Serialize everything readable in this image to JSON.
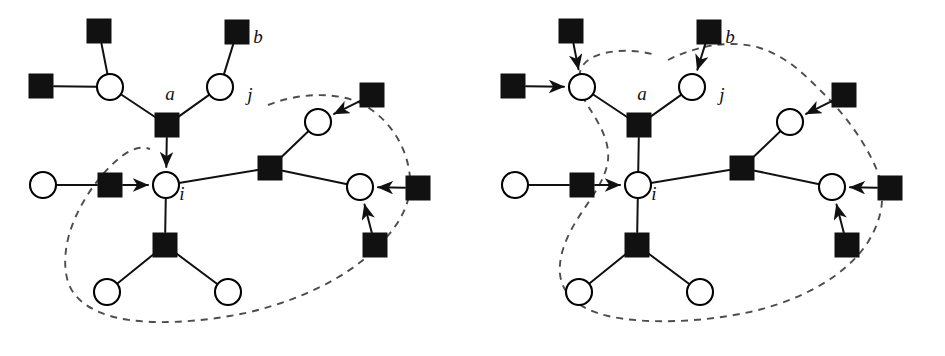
{
  "figure": {
    "colors": {
      "variable_node_fill": "#ffffff",
      "factor_node_fill": "#111111",
      "edge": "#111111",
      "region_boundary": "#4d4d4d",
      "background": "#ffffff"
    },
    "legend_note": ""
  },
  "panels": [
    {
      "id": "left",
      "name": "panel-left",
      "region_label": "",
      "labels": [
        {
          "id": "a",
          "text": "a",
          "x": 170,
          "y": 100
        },
        {
          "id": "b",
          "text": "b",
          "x": 258,
          "y": 43
        },
        {
          "id": "i",
          "text": "i",
          "x": 182,
          "y": 200
        },
        {
          "id": "j",
          "text": "j",
          "x": 250,
          "y": 101
        }
      ],
      "variable_nodes": [
        {
          "id": "v_tl",
          "name": "variable-node-top-left",
          "x": 110,
          "y": 87
        },
        {
          "id": "v_j",
          "name": "variable-node-j",
          "x": 220,
          "y": 87
        },
        {
          "id": "v_left",
          "name": "variable-node-left",
          "x": 43,
          "y": 185
        },
        {
          "id": "v_i",
          "name": "variable-node-i",
          "x": 166,
          "y": 185
        },
        {
          "id": "v_ur",
          "name": "variable-node-upper-right",
          "x": 318,
          "y": 122
        },
        {
          "id": "v_r",
          "name": "variable-node-right",
          "x": 360,
          "y": 187
        },
        {
          "id": "v_bl",
          "name": "variable-node-bottom-left",
          "x": 107,
          "y": 292
        },
        {
          "id": "v_br",
          "name": "variable-node-bottom-right",
          "x": 228,
          "y": 292
        }
      ],
      "factor_nodes": [
        {
          "id": "f_top",
          "name": "factor-node-top",
          "x": 99,
          "y": 31
        },
        {
          "id": "f_b",
          "name": "factor-node-b",
          "x": 237,
          "y": 32
        },
        {
          "id": "f_farl",
          "name": "factor-node-far-left",
          "x": 41,
          "y": 86
        },
        {
          "id": "f_a",
          "name": "factor-node-a",
          "x": 167,
          "y": 125
        },
        {
          "id": "f_midl",
          "name": "factor-node-mid-left",
          "x": 110,
          "y": 185
        },
        {
          "id": "f_mid",
          "name": "factor-node-middle",
          "x": 270,
          "y": 168
        },
        {
          "id": "f_ur",
          "name": "factor-node-upper-right",
          "x": 372,
          "y": 95
        },
        {
          "id": "f_farr",
          "name": "factor-node-far-right",
          "x": 418,
          "y": 188
        },
        {
          "id": "f_lr",
          "name": "factor-node-lower-right",
          "x": 375,
          "y": 245
        },
        {
          "id": "f_bot",
          "name": "factor-node-bottom",
          "x": 165,
          "y": 245
        }
      ],
      "messages": [
        {
          "id": "m_a_i",
          "from": "f_a",
          "to": "v_i"
        },
        {
          "id": "m_midl_i",
          "from": "f_midl",
          "to": "v_i"
        },
        {
          "id": "m_ur_vur",
          "from": "f_ur",
          "to": "v_ur"
        },
        {
          "id": "m_farr_vr",
          "from": "f_farr",
          "to": "v_r"
        },
        {
          "id": "m_lr_vr",
          "from": "f_lr",
          "to": "v_r"
        }
      ]
    },
    {
      "id": "right",
      "name": "panel-right",
      "region_label": "",
      "labels": [
        {
          "id": "a",
          "text": "a",
          "x": 170,
          "y": 100
        },
        {
          "id": "b",
          "text": "b",
          "x": 258,
          "y": 43
        },
        {
          "id": "i",
          "text": "i",
          "x": 182,
          "y": 200
        },
        {
          "id": "j",
          "text": "j",
          "x": 250,
          "y": 101
        }
      ],
      "variable_nodes": [
        {
          "id": "v_tl",
          "name": "variable-node-top-left",
          "x": 110,
          "y": 87
        },
        {
          "id": "v_j",
          "name": "variable-node-j",
          "x": 220,
          "y": 87
        },
        {
          "id": "v_left",
          "name": "variable-node-left",
          "x": 43,
          "y": 185
        },
        {
          "id": "v_i",
          "name": "variable-node-i",
          "x": 166,
          "y": 185
        },
        {
          "id": "v_ur",
          "name": "variable-node-upper-right",
          "x": 318,
          "y": 122
        },
        {
          "id": "v_r",
          "name": "variable-node-right",
          "x": 360,
          "y": 187
        },
        {
          "id": "v_bl",
          "name": "variable-node-bottom-left",
          "x": 107,
          "y": 292
        },
        {
          "id": "v_br",
          "name": "variable-node-bottom-right",
          "x": 228,
          "y": 292
        }
      ],
      "factor_nodes": [
        {
          "id": "f_top",
          "name": "factor-node-top",
          "x": 99,
          "y": 31
        },
        {
          "id": "f_b",
          "name": "factor-node-b",
          "x": 237,
          "y": 32
        },
        {
          "id": "f_farl",
          "name": "factor-node-far-left",
          "x": 41,
          "y": 86
        },
        {
          "id": "f_a",
          "name": "factor-node-a",
          "x": 167,
          "y": 125
        },
        {
          "id": "f_midl",
          "name": "factor-node-mid-left",
          "x": 110,
          "y": 185
        },
        {
          "id": "f_mid",
          "name": "factor-node-middle",
          "x": 270,
          "y": 168
        },
        {
          "id": "f_ur",
          "name": "factor-node-upper-right",
          "x": 372,
          "y": 95
        },
        {
          "id": "f_farr",
          "name": "factor-node-far-right",
          "x": 418,
          "y": 188
        },
        {
          "id": "f_lr",
          "name": "factor-node-lower-right",
          "x": 375,
          "y": 245
        },
        {
          "id": "f_bot",
          "name": "factor-node-bottom",
          "x": 165,
          "y": 245
        }
      ],
      "messages": [
        {
          "id": "m_top_vtl",
          "from": "f_top",
          "to": "v_tl"
        },
        {
          "id": "m_farl_vtl",
          "from": "f_farl",
          "to": "v_tl"
        },
        {
          "id": "m_b_vj",
          "from": "f_b",
          "to": "v_j"
        },
        {
          "id": "m_midl_i",
          "from": "f_midl",
          "to": "v_i"
        },
        {
          "id": "m_ur_vur",
          "from": "f_ur",
          "to": "v_ur"
        },
        {
          "id": "m_farr_vr",
          "from": "f_farr",
          "to": "v_r"
        },
        {
          "id": "m_lr_vr",
          "from": "f_lr",
          "to": "v_r"
        }
      ]
    }
  ],
  "geometry": {
    "variable_radius": 13,
    "factor_half": 12,
    "edges": [
      [
        "f_top",
        "v_tl"
      ],
      [
        "f_farl",
        "v_tl"
      ],
      [
        "v_tl",
        "f_a"
      ],
      [
        "f_b",
        "v_j"
      ],
      [
        "v_j",
        "f_a"
      ],
      [
        "f_a",
        "v_i"
      ],
      [
        "v_left",
        "f_midl"
      ],
      [
        "f_midl",
        "v_i"
      ],
      [
        "v_i",
        "f_mid"
      ],
      [
        "f_mid",
        "v_ur"
      ],
      [
        "f_ur",
        "v_ur"
      ],
      [
        "f_mid",
        "v_r"
      ],
      [
        "f_farr",
        "v_r"
      ],
      [
        "f_lr",
        "v_r"
      ],
      [
        "v_i",
        "f_bot"
      ],
      [
        "f_bot",
        "v_bl"
      ],
      [
        "f_bot",
        "v_br"
      ]
    ],
    "region_left_path": "M 268,105 C 300,92 340,92 362,104 C 392,120 408,150 410,178 C 412,205 398,228 372,252 C 345,278 300,300 250,312 C 200,323 150,325 118,318 C 92,312 74,300 68,282 C 62,262 66,238 76,216 C 88,190 106,168 122,156 C 133,148 142,146 150,149",
    "region_right_path": "M 196,60 C 228,44 262,40 288,48 C 316,57 334,76 352,94 C 372,114 392,140 404,168 C 414,192 412,216 396,242 C 374,276 330,300 278,312 C 226,323 172,324 136,316 C 106,309 90,294 88,274 C 86,252 98,230 110,212 C 122,194 134,178 136,160 C 138,140 126,122 116,106 C 106,90 104,74 112,64 C 124,50 156,48 180,54"
  }
}
